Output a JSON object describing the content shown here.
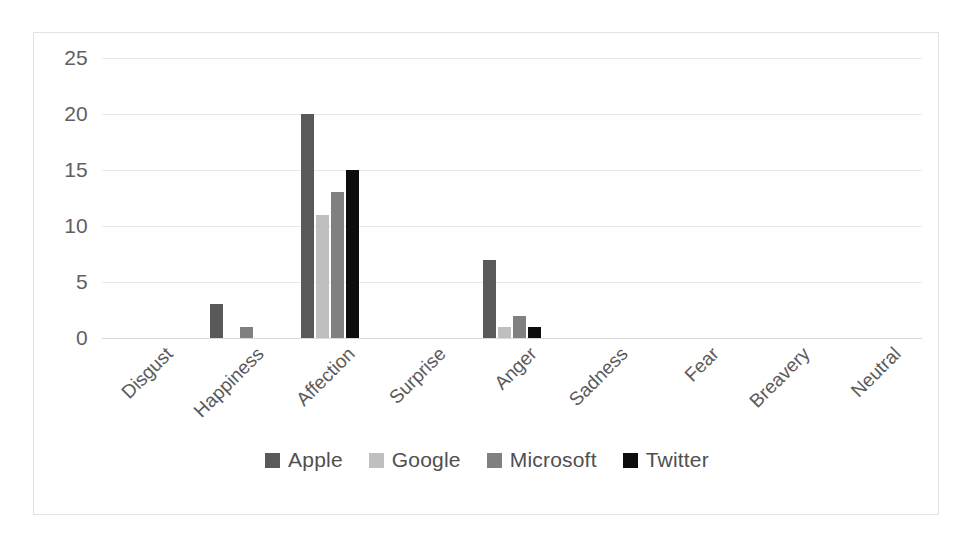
{
  "chart_data": {
    "type": "bar",
    "title": "",
    "subtitle": "",
    "xlabel": "",
    "ylabel": "",
    "ylim": [
      0,
      25
    ],
    "ytick_values": [
      0,
      5,
      10,
      15,
      20,
      25
    ],
    "ytick_labels": [
      "0",
      "5",
      "10",
      "15",
      "20",
      "25"
    ],
    "grid": true,
    "legend_position": "bottom",
    "categories": [
      "Disgust",
      "Happiness",
      "Affection",
      "Surprise",
      "Anger",
      "Sadness",
      "Fear",
      "Breavery",
      "Neutral"
    ],
    "series": [
      {
        "name": "Apple",
        "color": "#595959",
        "values": [
          0,
          3,
          20,
          0,
          7,
          0,
          0,
          0,
          0
        ]
      },
      {
        "name": "Google",
        "color": "#bfbfbf",
        "values": [
          0,
          0,
          11,
          0,
          1,
          0,
          0,
          0,
          0
        ]
      },
      {
        "name": "Microsoft",
        "color": "#808080",
        "values": [
          0,
          1,
          13,
          0,
          2,
          0,
          0,
          0,
          0
        ]
      },
      {
        "name": "Twitter",
        "color": "#0d0d0d",
        "values": [
          0,
          0,
          15,
          0,
          1,
          0,
          0,
          0,
          0
        ]
      }
    ]
  },
  "legend": {
    "items": [
      {
        "label": "Apple",
        "color": "#595959"
      },
      {
        "label": "Google",
        "color": "#bfbfbf"
      },
      {
        "label": "Microsoft",
        "color": "#808080"
      },
      {
        "label": "Twitter",
        "color": "#0d0d0d"
      }
    ]
  },
  "style": {
    "border_color": "#e2e2e2",
    "gridline_color": "#e8e8e8",
    "axis_text_color": "#5f5f5f",
    "background": "#ffffff"
  }
}
